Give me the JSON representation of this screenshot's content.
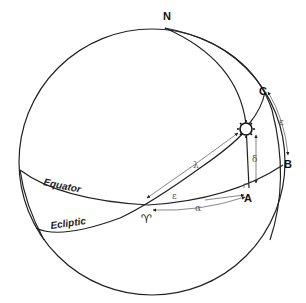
{
  "diagram": {
    "labels": {
      "north_pole": "N",
      "point_a": "A",
      "point_b": "B",
      "point_c": "C",
      "equator": "Equator",
      "ecliptic": "Ecliptic",
      "vernal_equinox": "♈",
      "longitude": "λ",
      "right_ascension": "α",
      "declination": "δ",
      "obliquity_angle": "ε",
      "obliquity_arc": "ε"
    },
    "objects": {
      "sun": "sun-icon"
    },
    "colors": {
      "stroke": "#222222",
      "arrow": "#555555",
      "background": "#ffffff"
    }
  }
}
